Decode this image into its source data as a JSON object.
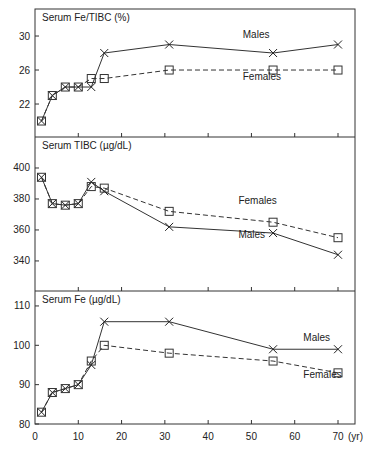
{
  "chart_data": [
    {
      "type": "line",
      "title": "Serum Fe/TIBC (%)",
      "xlabel": "Age (yr)",
      "ylabel": "",
      "x": [
        1.5,
        4,
        7,
        10,
        13,
        16,
        31,
        55,
        70
      ],
      "series": [
        {
          "name": "Males",
          "marker": "x",
          "line": "solid",
          "values": [
            20,
            23,
            24,
            24,
            24,
            28,
            29,
            28,
            29
          ]
        },
        {
          "name": "Females",
          "marker": "square",
          "line": "dashed",
          "values": [
            20,
            23,
            24,
            24,
            25,
            25,
            26,
            26,
            26
          ]
        }
      ],
      "yticks": [
        22,
        26,
        30
      ],
      "ylim": [
        18.1,
        33.2
      ],
      "labels": [
        {
          "text": "Males",
          "x": 48,
          "y": 29.8
        },
        {
          "text": "Females",
          "x": 48,
          "y": 24.8
        }
      ]
    },
    {
      "type": "line",
      "title": "Serum TIBC (µg/dL)",
      "xlabel": "Age (yr)",
      "ylabel": "",
      "x": [
        1.5,
        4,
        7,
        10,
        13,
        16,
        31,
        55,
        70
      ],
      "series": [
        {
          "name": "Males",
          "marker": "x",
          "line": "solid",
          "values": [
            394,
            377,
            376,
            377,
            391,
            385,
            362,
            358,
            344
          ]
        },
        {
          "name": "Females",
          "marker": "square",
          "line": "dashed",
          "values": [
            394,
            377,
            376,
            377,
            388,
            387,
            372,
            365,
            355
          ]
        }
      ],
      "yticks": [
        340,
        360,
        380,
        400
      ],
      "ylim": [
        320.6,
        420
      ],
      "labels": [
        {
          "text": "Females",
          "x": 47,
          "y": 377
        },
        {
          "text": "Males",
          "x": 47,
          "y": 355
        }
      ]
    },
    {
      "type": "line",
      "title": "Serum Fe (µg/dL)",
      "xlabel": "(yr)",
      "ylabel": "",
      "x": [
        1.5,
        4,
        7,
        10,
        13,
        16,
        31,
        55,
        70
      ],
      "series": [
        {
          "name": "Males",
          "marker": "x",
          "line": "solid",
          "values": [
            83,
            88,
            89,
            90,
            95,
            106,
            106,
            99,
            99
          ]
        },
        {
          "name": "Females",
          "marker": "square",
          "line": "dashed",
          "values": [
            83,
            88,
            89,
            90,
            96,
            100,
            98,
            96,
            93
          ]
        }
      ],
      "yticks": [
        80,
        90,
        100,
        110
      ],
      "ylim": [
        80,
        113.8
      ],
      "xticks": [
        0,
        10,
        20,
        30,
        40,
        50,
        60,
        70
      ],
      "xlim": [
        0,
        73
      ],
      "labels": [
        {
          "text": "Males",
          "x": 62,
          "y": 101
        },
        {
          "text": "Females",
          "x": 62,
          "y": 91.7
        }
      ]
    }
  ],
  "axis": {
    "x_unit": "(yr)",
    "x_tick_labels": [
      "0",
      "10",
      "20",
      "30",
      "40",
      "50",
      "60",
      "70"
    ]
  }
}
